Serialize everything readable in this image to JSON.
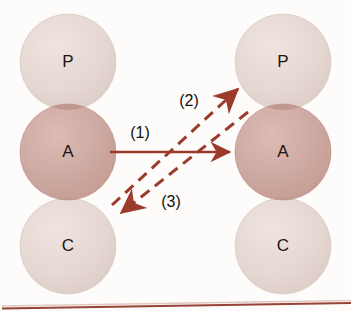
{
  "figure": {
    "background_color": "#fdfcfb",
    "width": 351,
    "height": 311
  },
  "palette": {
    "circle_light": "#e5d7d2",
    "circle_light_stroke": "#ddcbc5",
    "circle_dark": "#cda9a1",
    "circle_dark_stroke": "#c29b92",
    "overlap_dark": "#bf968d",
    "arrow_color": "#9c3a2c",
    "arrow_color_dashed": "#9c3a2c",
    "baseline_color": "#8c2f22",
    "text_color": "#1d1612"
  },
  "left_column": {
    "name": "left-cell-stack",
    "nodes": [
      {
        "id": "left-p",
        "label": "P",
        "cx": 68,
        "cy": 62,
        "r": 48,
        "tone": "light"
      },
      {
        "id": "left-a",
        "label": "A",
        "cx": 68,
        "cy": 152,
        "r": 48,
        "tone": "dark"
      },
      {
        "id": "left-c",
        "label": "C",
        "cx": 68,
        "cy": 246,
        "r": 48,
        "tone": "light"
      }
    ]
  },
  "right_column": {
    "name": "right-cell-stack",
    "nodes": [
      {
        "id": "right-p",
        "label": "P",
        "cx": 283,
        "cy": 62,
        "r": 48,
        "tone": "light"
      },
      {
        "id": "right-a",
        "label": "A",
        "cx": 283,
        "cy": 152,
        "r": 48,
        "tone": "dark"
      },
      {
        "id": "right-c",
        "label": "C",
        "cx": 283,
        "cy": 246,
        "r": 48,
        "tone": "light"
      }
    ]
  },
  "arrows": [
    {
      "id": "arrow-1",
      "label": "(1)",
      "style": "solid",
      "from": "left-a",
      "to": "right-a",
      "x1": 112,
      "y1": 152,
      "x2": 234,
      "y2": 152,
      "label_x": 140,
      "label_y": 134
    },
    {
      "id": "arrow-2",
      "label": "(2)",
      "style": "dashed",
      "from": "left-a",
      "to": "right-p",
      "x1": 112,
      "y1": 205,
      "x2": 242,
      "y2": 86,
      "label_x": 189,
      "label_y": 102
    },
    {
      "id": "arrow-3",
      "label": "(3)",
      "style": "dashed",
      "from": "right-a",
      "to": "left-c",
      "x1": 248,
      "y1": 112,
      "x2": 117,
      "y2": 216,
      "label_x": 171,
      "label_y": 203
    }
  ],
  "baseline": {
    "name": "bottom-rule",
    "x1": 4,
    "y1": 308,
    "x2": 351,
    "y2": 303
  }
}
